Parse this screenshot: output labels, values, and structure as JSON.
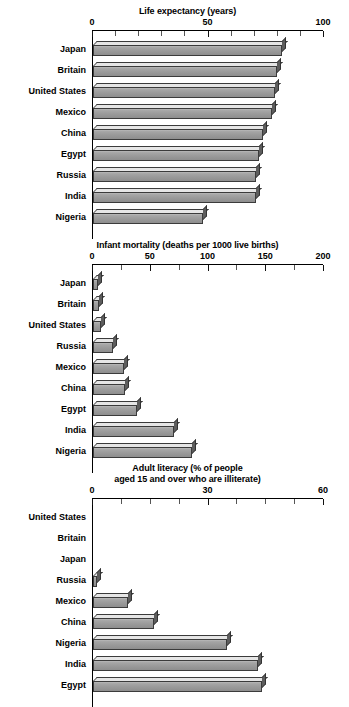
{
  "chart_data": [
    {
      "type": "bar",
      "orientation": "horizontal",
      "title": "Life expectancy (years)",
      "title_lines": [
        "Life expectancy (years)"
      ],
      "xlabel": "",
      "ylabel": "",
      "xlim": [
        0,
        100
      ],
      "xticks": [
        0,
        50,
        100
      ],
      "xtick_labels": [
        "0",
        "50",
        "100"
      ],
      "minor_tick_step": 10,
      "grid": false,
      "legend": false,
      "categories": [
        "Japan",
        "Britain",
        "United States",
        "Mexico",
        "China",
        "Egypt",
        "Russia",
        "India",
        "Nigeria"
      ],
      "values": [
        82,
        80,
        79,
        78,
        74,
        72,
        71,
        71,
        48
      ],
      "bar_color": "#9a9a9a"
    },
    {
      "type": "bar",
      "orientation": "horizontal",
      "title": "Infant mortality (deaths per 1000 live births)",
      "title_lines": [
        "Infant mortality (deaths per 1000 live births)"
      ],
      "xlabel": "",
      "ylabel": "",
      "xlim": [
        0,
        200
      ],
      "xticks": [
        0,
        50,
        100,
        150,
        200
      ],
      "xtick_labels": [
        "0",
        "50",
        "100",
        "150",
        "200"
      ],
      "minor_tick_step": 25,
      "grid": false,
      "legend": false,
      "categories": [
        "Japan",
        "Britain",
        "United States",
        "Russia",
        "Mexico",
        "China",
        "Egypt",
        "India",
        "Nigeria"
      ],
      "values": [
        4,
        5,
        7,
        17,
        27,
        28,
        38,
        70,
        86
      ],
      "bar_color": "#9a9a9a"
    },
    {
      "type": "bar",
      "orientation": "horizontal",
      "title": "Adult literacy (% of people aged 15 and over who are illiterate)",
      "title_lines": [
        "Adult literacy (% of people",
        "aged 15 and over who are illiterate)"
      ],
      "xlabel": "",
      "ylabel": "",
      "xlim": [
        0,
        60
      ],
      "xticks": [
        0,
        30,
        60
      ],
      "xtick_labels": [
        "0",
        "30",
        "60"
      ],
      "minor_tick_step": 7.5,
      "grid": false,
      "legend": false,
      "categories": [
        "United States",
        "Britain",
        "Japan",
        "Russia",
        "Mexico",
        "China",
        "Nigeria",
        "India",
        "Egypt"
      ],
      "values": [
        0,
        0,
        0,
        1,
        9,
        16,
        35,
        43,
        44
      ],
      "bar_color": "#9a9a9a"
    }
  ]
}
